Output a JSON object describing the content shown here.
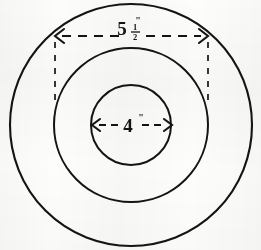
{
  "figure": {
    "background_color": "#fdfdfc",
    "ink_color": "#141414",
    "center": {
      "x": 131,
      "y": 125
    }
  },
  "circles": [
    {
      "name": "outer-circle",
      "radius": 121,
      "stroke_width": 2.1
    },
    {
      "name": "middle-circle",
      "radius": 77,
      "stroke_width": 2.0
    },
    {
      "name": "inner-circle",
      "radius": 40,
      "stroke_width": 2.0
    }
  ],
  "dimensions": {
    "outer": {
      "label_whole": "5",
      "fraction_numerator": "1",
      "fraction_denominator": "2",
      "inch_mark": "\"",
      "full_text": "5 1/2\"",
      "measures": "middle-circle-diameter",
      "line_y": 36,
      "left_x": 55,
      "right_x": 208,
      "extension_bottom_left_y": 104,
      "extension_bottom_right_y": 104
    },
    "inner": {
      "label_whole": "4",
      "inch_mark": "\"",
      "full_text": "4\"",
      "measures": "inner-circle-diameter",
      "line_y": 125,
      "left_x": 92,
      "right_x": 172
    }
  },
  "style": {
    "dash_pattern": "9 7",
    "dash_pattern_small": "7 5",
    "extension_dash_pattern": "6 7"
  }
}
